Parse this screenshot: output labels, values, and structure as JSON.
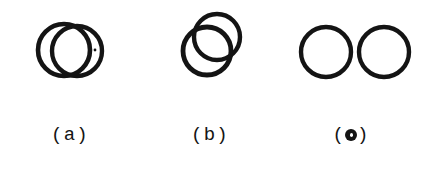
{
  "document": {
    "kind": "scanned-figure",
    "background_color": "#ffffff",
    "ink_color": "#141414",
    "width": 421,
    "height": 171
  },
  "figure": {
    "panels": [
      {
        "id": "a",
        "caption": "(a)",
        "caption_prefix": "(",
        "caption_letter": "a",
        "caption_suffix": ")",
        "description": "two heavily overlapping circles, crescent sliver visible on right",
        "overlap": "high",
        "shapes": [
          {
            "name": "circle-left",
            "cx": 64,
            "cy": 50,
            "r": 26,
            "stroke_width": 4.6
          },
          {
            "name": "circle-right",
            "cx": 77,
            "cy": 51,
            "r": 25,
            "stroke_width": 4.4
          }
        ],
        "marks": [
          {
            "name": "ink-speck",
            "cx": 95,
            "cy": 50,
            "r": 1.4
          }
        ]
      },
      {
        "id": "b",
        "caption": "(b)",
        "caption_prefix": "(",
        "caption_letter": "b",
        "caption_suffix": ")",
        "description": "two circles overlapping diagonally, one lower-left and one upper-right",
        "overlap": "medium",
        "shapes": [
          {
            "name": "circle-upper-right",
            "cx": 77,
            "cy": 37,
            "r": 23,
            "stroke_width": 4.4
          },
          {
            "name": "circle-lower-left",
            "cx": 67,
            "cy": 51,
            "r": 24,
            "stroke_width": 4.8
          }
        ],
        "marks": []
      },
      {
        "id": "c",
        "caption": "(c)",
        "caption_prefix": "(",
        "caption_letter": "c",
        "caption_suffix": ")",
        "caption_letter_style": "over-inked-blot",
        "description": "two separate non-overlapping circles side by side",
        "overlap": "none",
        "shapes": [
          {
            "name": "circle-left",
            "cx": 45,
            "cy": 52,
            "r": 25,
            "stroke_width": 4.4
          },
          {
            "name": "circle-right",
            "cx": 103,
            "cy": 52,
            "r": 25,
            "stroke_width": 4.4
          }
        ],
        "marks": []
      }
    ]
  }
}
